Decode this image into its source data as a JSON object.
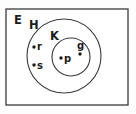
{
  "diagram": {
    "kind": "euler-venn-diagram",
    "canvas": {
      "width": 136,
      "height": 114
    },
    "colors": {
      "background": "#fdfdfd",
      "stroke": "#3a3a3a",
      "text": "#1b1b1b",
      "dot": "#1b1b1b"
    },
    "universe": {
      "label": "E",
      "label_x": 14,
      "label_y": 24,
      "rect": {
        "x": 6,
        "y": 9,
        "width": 122,
        "height": 96
      }
    },
    "sets": [
      {
        "name": "H",
        "label": "H",
        "label_x": 29,
        "label_y": 29,
        "cx": 64,
        "cy": 56,
        "r": 37
      },
      {
        "name": "K",
        "label": "K",
        "label_x": 50,
        "label_y": 40,
        "cx": 71,
        "cy": 57,
        "r": 19
      }
    ],
    "elements": [
      {
        "label": "r",
        "dot_x": 34,
        "dot_y": 47,
        "label_x": 37,
        "label_y": 50,
        "member_of": "H"
      },
      {
        "label": "s",
        "dot_x": 34,
        "dot_y": 65,
        "label_x": 37,
        "label_y": 69,
        "member_of": "H"
      },
      {
        "label": "p",
        "dot_x": 61,
        "dot_y": 58,
        "label_x": 64,
        "label_y": 62,
        "member_of": "K"
      },
      {
        "label": "g",
        "dot_x": 80,
        "dot_y": 54,
        "label_x": 77,
        "label_y": 49,
        "member_of": "K"
      }
    ]
  }
}
